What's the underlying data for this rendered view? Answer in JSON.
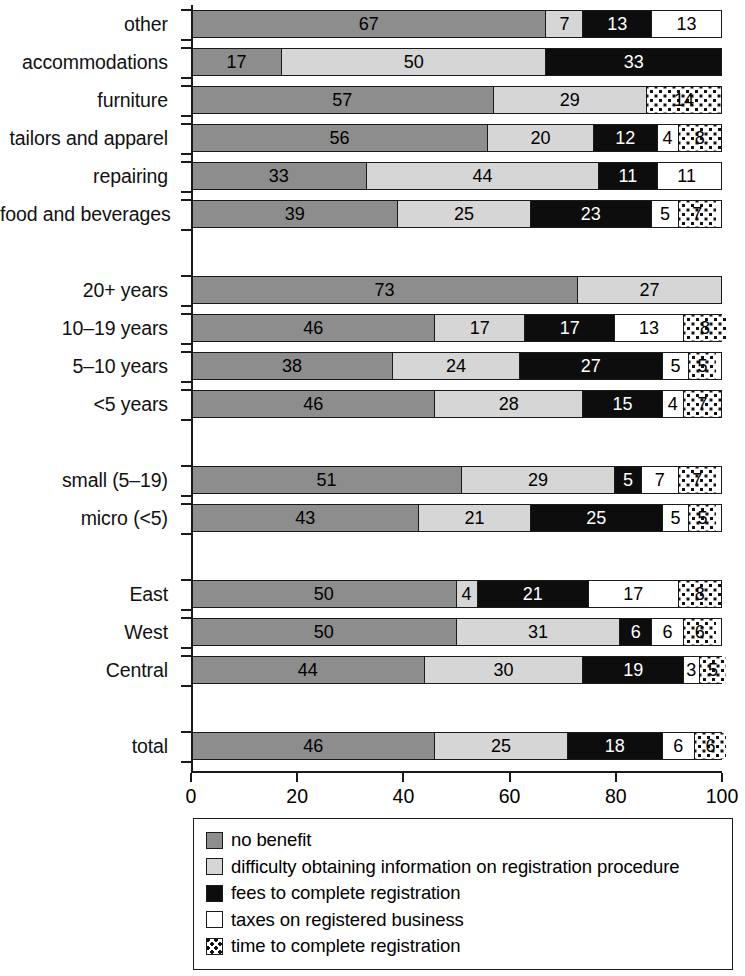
{
  "chart_data": {
    "type": "bar",
    "subtype": "horizontal-stacked-100",
    "title": "",
    "xlabel": "percent of firms",
    "ylabel": "",
    "xlim": [
      0,
      100
    ],
    "xticks": [
      0,
      20,
      40,
      60,
      80,
      100
    ],
    "xtick_labels": [
      "0",
      "20",
      "40",
      "60",
      "80",
      "100"
    ],
    "grid": false,
    "legend_position": "bottom",
    "series": [
      {
        "name": "no benefit",
        "key": "no_benefit",
        "style": "s-nobenefit",
        "color": "#8d8d8d"
      },
      {
        "name": "difficulty obtaining information on registration procedure",
        "key": "difficulty",
        "style": "s-difficulty",
        "color": "#d6d6d6"
      },
      {
        "name": "fees to complete registration",
        "key": "fees",
        "style": "s-fees",
        "color": "#0d0d0d"
      },
      {
        "name": "taxes on registered business",
        "key": "taxes",
        "style": "s-taxes",
        "color": "#ffffff"
      },
      {
        "name": "time to complete registration",
        "key": "time",
        "style": "s-time",
        "color": "#ffffff-dotted"
      }
    ],
    "groups": [
      {
        "name": "sector",
        "rows": [
          {
            "category": "other",
            "values": [
              67,
              7,
              13,
              13,
              0
            ]
          },
          {
            "category": "accommodations",
            "values": [
              17,
              50,
              33,
              0,
              0
            ]
          },
          {
            "category": "furniture",
            "values": [
              57,
              29,
              0,
              0,
              14
            ]
          },
          {
            "category": "tailors and apparel",
            "values": [
              56,
              20,
              12,
              4,
              8
            ]
          },
          {
            "category": "repairing",
            "values": [
              33,
              44,
              11,
              11,
              0
            ]
          },
          {
            "category": "food and beverages",
            "values": [
              39,
              25,
              23,
              5,
              7
            ]
          }
        ]
      },
      {
        "name": "age",
        "rows": [
          {
            "category": "20+ years",
            "values": [
              73,
              27,
              0,
              0,
              0
            ]
          },
          {
            "category": "10–19 years",
            "values": [
              46,
              17,
              17,
              13,
              8
            ]
          },
          {
            "category": "5–10 years",
            "values": [
              38,
              24,
              27,
              5,
              5
            ]
          },
          {
            "category": "<5 years",
            "values": [
              46,
              28,
              15,
              4,
              7
            ]
          }
        ]
      },
      {
        "name": "size",
        "rows": [
          {
            "category": "small (5–19)",
            "values": [
              51,
              29,
              5,
              7,
              7
            ]
          },
          {
            "category": "micro (<5)",
            "values": [
              43,
              21,
              25,
              5,
              5
            ]
          }
        ]
      },
      {
        "name": "region",
        "rows": [
          {
            "category": "East",
            "values": [
              50,
              4,
              21,
              17,
              8
            ]
          },
          {
            "category": "West",
            "values": [
              50,
              31,
              6,
              6,
              6
            ]
          },
          {
            "category": "Central",
            "values": [
              44,
              30,
              19,
              3,
              5
            ]
          }
        ]
      },
      {
        "name": "all",
        "rows": [
          {
            "category": "total",
            "values": [
              46,
              25,
              18,
              6,
              6
            ]
          }
        ]
      }
    ]
  },
  "axis": {
    "x_label": "percent of firms",
    "tick_labels": [
      "0",
      "20",
      "40",
      "60",
      "80",
      "100"
    ]
  },
  "legend": {
    "items": [
      {
        "label": "no benefit",
        "style": "s-nobenefit",
        "icon": "legend-swatch-no-benefit"
      },
      {
        "label": "difficulty obtaining information on registration procedure",
        "style": "s-difficulty",
        "icon": "legend-swatch-difficulty"
      },
      {
        "label": "fees to complete registration",
        "style": "s-fees",
        "icon": "legend-swatch-fees"
      },
      {
        "label": "taxes on registered business",
        "style": "s-taxes",
        "icon": "legend-swatch-taxes"
      },
      {
        "label": "time to complete registration",
        "style": "s-time",
        "icon": "legend-swatch-time"
      }
    ]
  }
}
